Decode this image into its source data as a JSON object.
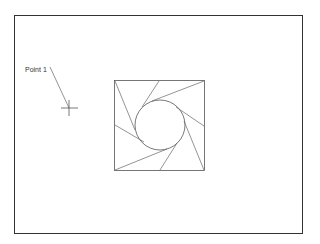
{
  "drawing": {
    "point_label": "Point 1",
    "stroke_color": "#555555",
    "frame_color": "#333333"
  }
}
